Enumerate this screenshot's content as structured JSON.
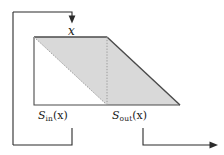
{
  "figure": {
    "background_color": "#ffffff",
    "stroke_color": "#3a3a3a",
    "fill_color": "#d9d9d9",
    "dotted_color": "#999999",
    "labels": {
      "x": "x",
      "s_in_base": "S",
      "s_in_sub": "in",
      "s_in_arg": "(x)",
      "s_out_base": "S",
      "s_out_sub": "out",
      "s_out_arg": "(x)"
    },
    "geometry": {
      "top_left": [
        34,
        37
      ],
      "top_right": [
        107,
        37
      ],
      "bottom_right_vertex": [
        180,
        105
      ],
      "bottom_left": [
        34,
        105
      ],
      "divider_x": 107,
      "baseline_y": 105
    },
    "annotations": {
      "top_bracket": "arrow pointing down to top edge labelled x",
      "left_bracket": "bracket from top-left down to S_in(x) span",
      "right_arrow": "arrow from S_out(x) span extending right"
    }
  }
}
